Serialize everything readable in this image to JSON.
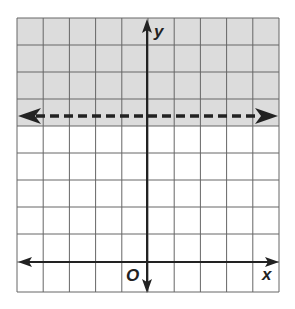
{
  "diagram": {
    "type": "coordinate-plane-inequality",
    "axis_labels": {
      "x": "x",
      "y": "y",
      "origin": "O"
    },
    "grid": {
      "columns": 10,
      "rows": 11
    },
    "boundary_line": {
      "style": "dashed",
      "orientation": "horizontal",
      "arrows": "both"
    },
    "shaded_region": "above boundary line",
    "colors": {
      "shade": "#dcdcdc",
      "grid": "#555555",
      "axis": "#222222",
      "background": "#ffffff"
    }
  }
}
